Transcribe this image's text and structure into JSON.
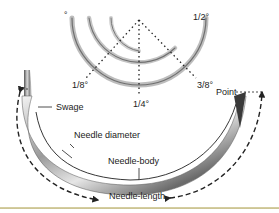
{
  "diagram": {
    "curvature_labels": {
      "eighth": "1/8°",
      "quarter": "1/4°",
      "three_eighths": "3/8°",
      "half": "1/2°",
      "circle_marker": "°"
    },
    "part_labels": {
      "swage": "Swage",
      "point": "Point",
      "needle_diameter": "Needle diameter",
      "needle_body": "Needle-body",
      "needle_length": "Needle-length"
    },
    "colors": {
      "text": "#222222",
      "lines": "#222222",
      "bottom_rule": "#cfc799",
      "background": "#ffffff"
    }
  }
}
